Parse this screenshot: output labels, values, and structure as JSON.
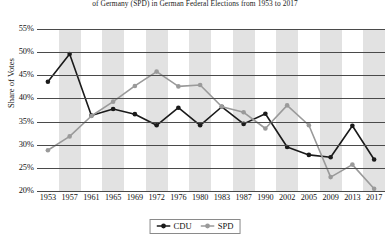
{
  "title": "of Germany (SPD) in German Federal Elections from 1953 to 2017",
  "axes": {
    "ylabel": "Share of Votes",
    "yticks": [
      "55%",
      "50%",
      "45%",
      "40%",
      "35%",
      "30%",
      "25%",
      "20%"
    ]
  },
  "legend": {
    "items": [
      {
        "label": "CDU",
        "color": "#1a1a1a"
      },
      {
        "label": "SPD",
        "color": "#9a9a9a"
      }
    ]
  },
  "chart_data": {
    "type": "line",
    "title": "of Germany (SPD) in German Federal Elections from 1953 to 2017",
    "xlabel": "",
    "ylabel": "Share of Votes",
    "ylim": [
      20,
      55
    ],
    "ytick_step": 5,
    "grid": true,
    "legend_position": "bottom",
    "banded_background": true,
    "categories": [
      "1953",
      "1957",
      "1961",
      "1965",
      "1969",
      "1972",
      "1976",
      "1980",
      "1983",
      "1987",
      "1990",
      "2002",
      "2005",
      "2009",
      "2013",
      "2017"
    ],
    "series": [
      {
        "name": "CDU",
        "color": "#1a1a1a",
        "marker": "circle",
        "values": [
          43.6,
          49.6,
          36.3,
          37.7,
          36.6,
          34.2,
          38.0,
          34.2,
          38.2,
          34.5,
          36.7,
          29.5,
          27.8,
          27.3,
          34.1,
          26.8
        ]
      },
      {
        "name": "SPD",
        "color": "#9a9a9a",
        "marker": "circle",
        "values": [
          28.8,
          31.8,
          36.2,
          39.3,
          42.7,
          45.8,
          42.6,
          42.9,
          38.2,
          37.0,
          33.5,
          38.5,
          34.2,
          23.0,
          25.7,
          20.5
        ]
      }
    ]
  }
}
